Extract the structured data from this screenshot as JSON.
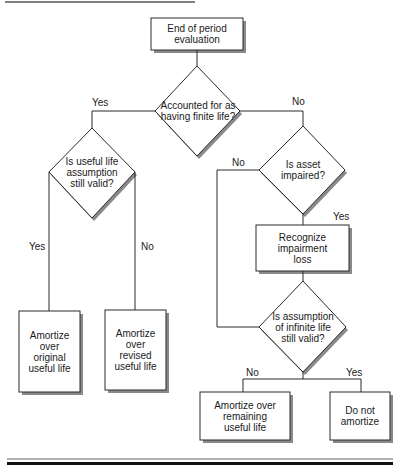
{
  "nodes": {
    "start": "End of period evaluation",
    "q_finite": "Accounted for as having finite life?",
    "q_useful": "Is useful life assumption still valid?",
    "a_original": "Amortize over original useful life",
    "a_revised": "Amortize over revised useful life",
    "q_impaired": "Is asset impaired?",
    "recognize": "Recognize impairment loss",
    "q_infinite": "Is assumption of infinite life still valid?",
    "a_remaining": "Amortize over remaining useful life",
    "a_none": "Do not amortize"
  },
  "edge_labels": {
    "finite_yes": "Yes",
    "finite_no": "No",
    "useful_yes": "Yes",
    "useful_no": "No",
    "impaired_no": "No",
    "impaired_yes": "Yes",
    "infinite_no": "No",
    "infinite_yes": "Yes"
  },
  "colors": {
    "line": "#2a2a2a",
    "shadow": "#8a8a8a",
    "bar": "#111111"
  }
}
